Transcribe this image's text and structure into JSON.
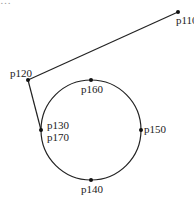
{
  "header": {
    "clipped_text": "…"
  },
  "diagram": {
    "title": "",
    "colors": {
      "stroke": "#222222",
      "point": "#111111",
      "label": "#222222"
    },
    "points": [
      {
        "id": "p110",
        "label": "p110",
        "x": 178,
        "y": 12
      },
      {
        "id": "p120",
        "label": "p120",
        "x": 28,
        "y": 80
      },
      {
        "id": "p130",
        "label": "p130",
        "x": 41,
        "y": 130
      },
      {
        "id": "p140",
        "label": "p140",
        "x": 91,
        "y": 180
      },
      {
        "id": "p150",
        "label": "p150",
        "x": 141,
        "y": 130
      },
      {
        "id": "p160",
        "label": "p160",
        "x": 91,
        "y": 80
      },
      {
        "id": "p170",
        "label": "p170",
        "x": 41,
        "y": 130
      }
    ],
    "segments": [
      {
        "from": "p110",
        "to": "p120"
      },
      {
        "from": "p120",
        "to": "p130"
      }
    ],
    "circle": {
      "cx": 91,
      "cy": 130,
      "r": 50,
      "through": [
        "p130",
        "p160",
        "p150",
        "p140",
        "p170"
      ]
    },
    "labels": {
      "p110": "p110",
      "p120": "p120",
      "p130": "p130",
      "p140": "p140",
      "p150": "p150",
      "p160": "p160",
      "p170": "p170"
    }
  }
}
